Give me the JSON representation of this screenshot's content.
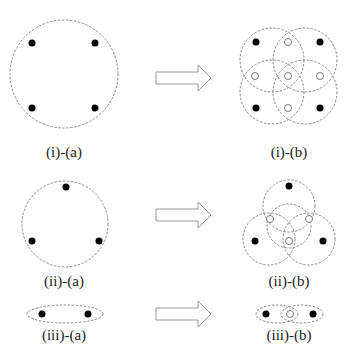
{
  "labels": {
    "i_a": "(i)-(a)",
    "i_b": "(i)-(b)",
    "ii_a": "(ii)-(a)",
    "ii_b": "(ii)-(b)",
    "iii_a": "(iii)-(a)",
    "iii_b": "(iii)-(b)"
  },
  "colors": {
    "dashed_stroke": "#8a8a8a",
    "dot_fill": "#000000",
    "arrow_stroke": "#9a9a9a"
  },
  "panels": [
    {
      "id": "i-a",
      "filled_dots": 4,
      "open_dots": 0,
      "dashed_shapes": 1
    },
    {
      "id": "i-b",
      "filled_dots": 4,
      "open_dots": 5,
      "dashed_shapes": 4
    },
    {
      "id": "ii-a",
      "filled_dots": 3,
      "open_dots": 0,
      "dashed_shapes": 1
    },
    {
      "id": "ii-b",
      "filled_dots": 3,
      "open_dots": 3,
      "dashed_shapes": 4
    },
    {
      "id": "iii-a",
      "filled_dots": 2,
      "open_dots": 0,
      "dashed_shapes": 1
    },
    {
      "id": "iii-b",
      "filled_dots": 2,
      "open_dots": 1,
      "dashed_shapes": 2
    }
  ]
}
